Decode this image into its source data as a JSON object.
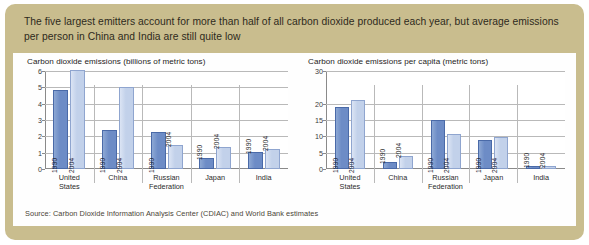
{
  "headline": "The five largest emitters account for more than half of all carbon dioxide produced each year, but average emissions per person in China and India are still quite low",
  "source": "Source: Carbon Dioxide Information Analysis Center (CDIAC) and World Bank estimates",
  "colors": {
    "frame": "#c9bd8e",
    "panel": "#fefefe",
    "bar_1990": "#6d8cc6",
    "bar_2004": "#c2d1ea",
    "gridline": "#b9b9b9",
    "axis": "#8a8a8a"
  },
  "chart_data": [
    {
      "type": "bar",
      "title": "Carbon dioxide emissions (billions of metric tons)",
      "xlabel": "",
      "ylabel": "",
      "ylim": [
        0,
        6
      ],
      "yticks": [
        0,
        1,
        2,
        3,
        4,
        5,
        6
      ],
      "ytick_labels": [
        "0",
        "1",
        "2",
        "3",
        "4",
        "5",
        "6"
      ],
      "grid": true,
      "legend": "none",
      "categories": [
        "United States",
        "China",
        "Russian Federation",
        "Japan",
        "India"
      ],
      "series": [
        {
          "name": "1990",
          "values": [
            4.85,
            2.4,
            2.25,
            0.68,
            1.05
          ]
        },
        {
          "name": "2004",
          "values": [
            6.05,
            5.0,
            1.5,
            1.35,
            1.2
          ]
        }
      ]
    },
    {
      "type": "bar",
      "title": "Carbon dioxide emissions per capita (metric tons)",
      "xlabel": "",
      "ylabel": "",
      "ylim": [
        0,
        30
      ],
      "yticks": [
        0,
        5,
        10,
        15,
        20,
        30
      ],
      "ytick_labels": [
        "0",
        "5",
        "10",
        "15",
        "20",
        "30"
      ],
      "grid": true,
      "legend": "none",
      "categories": [
        "United States",
        "China",
        "Russian Federation",
        "Japan",
        "India"
      ],
      "series": [
        {
          "name": "1990",
          "values": [
            19.0,
            2.0,
            14.9,
            8.9,
            0.8
          ]
        },
        {
          "name": "2004",
          "values": [
            21.0,
            4.0,
            10.8,
            9.8,
            0.9
          ]
        }
      ]
    }
  ]
}
